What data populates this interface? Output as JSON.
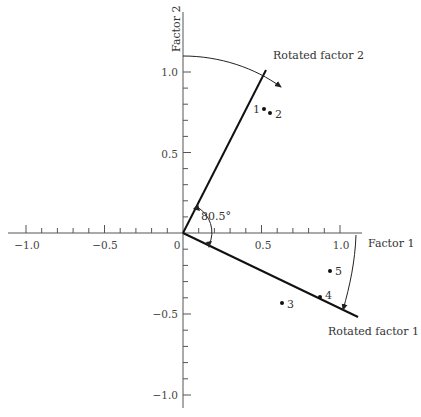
{
  "diagram": {
    "axes": {
      "x_label": "Factor 1",
      "y_label": "Factor 2",
      "x_ticks": [
        {
          "value": -1.0,
          "label": "−1.0"
        },
        {
          "value": -0.5,
          "label": "−0.5"
        },
        {
          "value": 0,
          "label": "0"
        },
        {
          "value": 0.5,
          "label": "0.5"
        },
        {
          "value": 1.0,
          "label": "1.0"
        }
      ],
      "y_ticks": [
        {
          "value": 1.0,
          "label": "1.0"
        },
        {
          "value": 0.5,
          "label": "0.5"
        },
        {
          "value": -0.5,
          "label": "−0.5"
        },
        {
          "value": -1.0,
          "label": "−1.0"
        }
      ],
      "minor_tick_step": 0.1
    },
    "rotated_axes": {
      "factor1_label": "Rotated factor 1",
      "factor2_label": "Rotated factor 2",
      "angle_label": "80.5°"
    },
    "points": [
      {
        "id": "1",
        "x": 0.52,
        "y": 0.77
      },
      {
        "id": "2",
        "x": 0.56,
        "y": 0.74
      },
      {
        "id": "3",
        "x": 0.63,
        "y": -0.43
      },
      {
        "id": "4",
        "x": 0.87,
        "y": -0.39
      },
      {
        "id": "5",
        "x": 0.93,
        "y": -0.23
      }
    ]
  }
}
